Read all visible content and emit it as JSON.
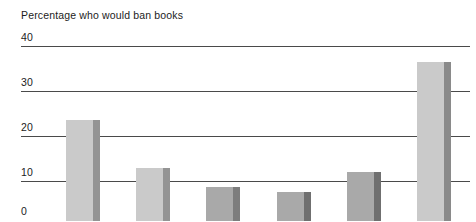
{
  "chart_data": {
    "type": "bar",
    "title": "Percentage who would ban books",
    "xlabel": "",
    "ylabel": "",
    "ylim": [
      0,
      40
    ],
    "yticks": [
      0,
      10,
      20,
      30,
      40
    ],
    "ytick_labels": [
      "0",
      "10",
      "20",
      "30",
      "40"
    ],
    "grid": true,
    "legend": "none",
    "categories": [
      "1",
      "2",
      "3",
      "4",
      "5",
      "6"
    ],
    "values": [
      23.5,
      13,
      8.7,
      7.5,
      12,
      36.5
    ],
    "bar_colors": [
      "#cacaca",
      "#cacaca",
      "#a9a9a9",
      "#a9a9a9",
      "#a9a9a9",
      "#cacaca"
    ],
    "bar_edge_colors": [
      "#949494",
      "#949494",
      "#7d7d7d",
      "#6f6f6f",
      "#6f6f6f",
      "#8a8a8a"
    ]
  },
  "axis": {
    "tick_0": "0",
    "tick_10": "10",
    "tick_20": "20",
    "tick_30": "30",
    "tick_40": "40"
  },
  "colors": {
    "gridline": "#4a4a4a",
    "text": "#1c1c1c",
    "background": "#ffffff",
    "bar_light": "#cacaca",
    "bar_medium": "#a9a9a9"
  }
}
